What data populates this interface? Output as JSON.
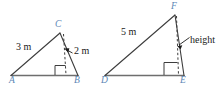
{
  "figure": {
    "colors": {
      "vertex_label": "#5b86b5",
      "measure_label": "#1a1a1a",
      "stroke": "#3d3d3d",
      "base_stroke": "#6e6e6e",
      "background": "#ffffff"
    },
    "triangles": [
      {
        "id": "left",
        "name": "triangle-abc",
        "vertices": [
          {
            "name": "A",
            "label": "A",
            "x": 12,
            "y": 80
          },
          {
            "name": "B",
            "label": "B",
            "x": 77,
            "y": 80
          },
          {
            "name": "C",
            "label": "C",
            "x": 59,
            "y": 30
          }
        ],
        "hypotenuse_label": "3 m",
        "height_label": "2 m",
        "right_angle_at": "foot-of-altitude"
      },
      {
        "id": "right",
        "name": "triangle-def",
        "vertices": [
          {
            "name": "D",
            "label": "D",
            "x": 106,
            "y": 80
          },
          {
            "name": "E",
            "label": "E",
            "x": 183,
            "y": 80
          },
          {
            "name": "F",
            "label": "F",
            "x": 174,
            "y": 12
          }
        ],
        "hypotenuse_label": "5 m",
        "height_label": "height",
        "right_angle_at": "foot-of-altitude"
      }
    ],
    "labels": {
      "a": "A",
      "b": "B",
      "c": "C",
      "d": "D",
      "e": "E",
      "f": "F",
      "three_m": "3 m",
      "two_m": "2 m",
      "five_m": "5 m",
      "height": "height"
    }
  }
}
